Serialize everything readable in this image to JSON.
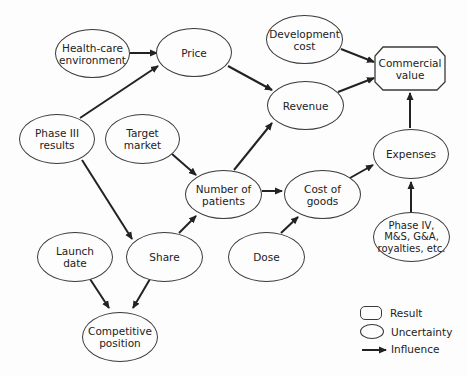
{
  "diagram": {
    "type": "influence-diagram",
    "nodes": {
      "healthcare": "Health-care\nenvironment",
      "price": "Price",
      "development_cost": "Development\ncost",
      "commercial_value": "Commercial\nvalue",
      "revenue": "Revenue",
      "phase3": "Phase III\nresults",
      "target_market": "Target\nmarket",
      "num_patients": "Number of\npatients",
      "cost_goods": "Cost of\ngoods",
      "expenses": "Expenses",
      "phase4": "Phase IV,\nM&S, G&A,\nroyalties, etc.",
      "launch_date": "Launch\ndate",
      "share": "Share",
      "dose": "Dose",
      "competitive": "Competitive\nposition"
    },
    "edges": [
      [
        "Health-care environment",
        "Price"
      ],
      [
        "Phase III results",
        "Price"
      ],
      [
        "Phase III results",
        "Share"
      ],
      [
        "Price",
        "Revenue"
      ],
      [
        "Development cost",
        "Commercial value"
      ],
      [
        "Revenue",
        "Commercial value"
      ],
      [
        "Target market",
        "Number of patients"
      ],
      [
        "Number of patients",
        "Revenue"
      ],
      [
        "Number of patients",
        "Cost of goods"
      ],
      [
        "Share",
        "Number of patients"
      ],
      [
        "Dose",
        "Cost of goods"
      ],
      [
        "Cost of goods",
        "Expenses"
      ],
      [
        "Expenses",
        "Commercial value"
      ],
      [
        "Phase IV, M&S, G&A, royalties, etc.",
        "Expenses"
      ],
      [
        "Launch date",
        "Competitive position"
      ],
      [
        "Share",
        "Competitive position"
      ]
    ]
  },
  "legend": {
    "result": "Result",
    "uncertainty": "Uncertainty",
    "influence": "Influence"
  }
}
